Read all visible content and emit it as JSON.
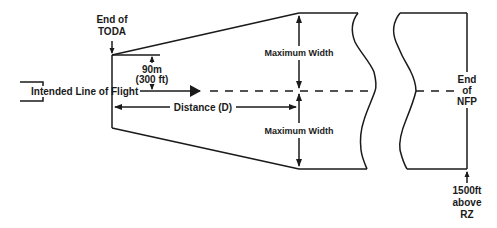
{
  "diagram": {
    "labels": {
      "end_of_toda_line1": "End of",
      "end_of_toda_line2": "TODA",
      "half_width_line1": "90m",
      "half_width_line2": "(300 ft)",
      "intended_line_of_flight": "Intended Line of Flight",
      "distance": "Distance (D)",
      "max_width_upper": "Maximum Width",
      "max_width_lower": "Maximum Width",
      "end_of_nfp_line1": "End",
      "end_of_nfp_line2": "of",
      "end_of_nfp_line3": "NFP",
      "altitude_line1": "1500ft",
      "altitude_line2": "above",
      "altitude_line3": "RZ"
    },
    "colors": {
      "line": "#1a1a1a",
      "background": "#ffffff"
    }
  }
}
